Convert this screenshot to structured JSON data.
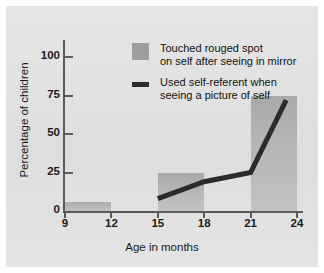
{
  "chart_data": {
    "type": "bar",
    "title": "",
    "xlabel": "Age in months",
    "ylabel": "Percentage of children",
    "xlim": [
      9,
      24
    ],
    "ylim": [
      0,
      112
    ],
    "grid": false,
    "legend_position": "top-right-inside",
    "x_ticks": [
      "9",
      "12",
      "15",
      "18",
      "21",
      "24"
    ],
    "x_tick_values": [
      9,
      12,
      15,
      18,
      21,
      24
    ],
    "y_ticks": [
      "0",
      "25",
      "50",
      "75",
      "100"
    ],
    "y_tick_values": [
      0,
      25,
      50,
      75,
      100
    ],
    "series": [
      {
        "name": "Touched rouged spot on self after seeing in mirror",
        "type": "bar",
        "legend_line1": "Touched rouged spot",
        "legend_line2": "on self after seeing in mirror",
        "color": "#b3b3b3",
        "bars": [
          {
            "x_start": 9,
            "x_end": 12,
            "value": 6
          },
          {
            "x_start": 15,
            "x_end": 18,
            "value": 25
          },
          {
            "x_start": 21,
            "x_end": 24,
            "value": 75
          }
        ]
      },
      {
        "name": "Used self-referent when seeing a picture of self",
        "type": "line",
        "legend_line1": "Used self-referent when",
        "legend_line2": "seeing a picture of self",
        "color": "#2b2b2b",
        "points": [
          {
            "x": 15,
            "y": 8
          },
          {
            "x": 18,
            "y": 19
          },
          {
            "x": 21,
            "y": 25
          },
          {
            "x": 23.3,
            "y": 72
          }
        ]
      }
    ]
  },
  "colors": {
    "panel_background": "#e2e2e2",
    "bar_fill": "#b3b3b3",
    "line_stroke": "#2b2b2b",
    "axis": "#5a5a5a",
    "text": "#1b1b1b"
  }
}
